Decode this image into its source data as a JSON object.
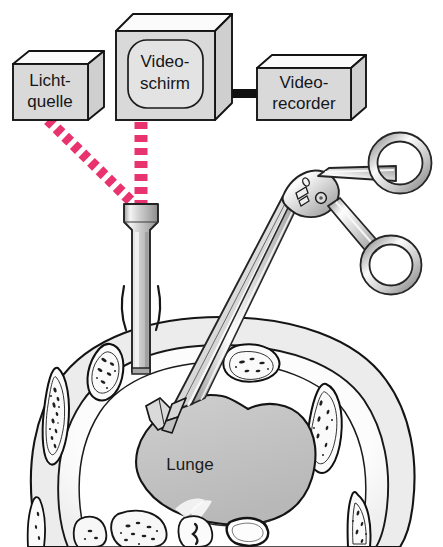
{
  "figure": {
    "background_color": "#ffffff",
    "width": 443,
    "height": 547
  },
  "equipment": {
    "light_source": {
      "label_line1": "Licht-",
      "label_line2": "quelle",
      "face_color": "#d9d9d9",
      "top_color": "#fbfbfb",
      "outline_color": "#1a1a1a"
    },
    "video_monitor": {
      "label_line1": "Video-",
      "label_line2": "schirm",
      "face_color": "#d9d9d9",
      "top_color": "#fbfbfb",
      "screen_color": "#e3e3e3",
      "outline_color": "#1a1a1a"
    },
    "video_recorder": {
      "label_line1": "Video-",
      "label_line2": "recorder",
      "face_color": "#d9d9d9",
      "top_color": "#fbfbfb",
      "outline_color": "#1a1a1a"
    },
    "cable": {
      "name": "monitor-to-recorder-cable",
      "color": "#111111"
    }
  },
  "signal_beams": {
    "color": "#e8336e",
    "beams": [
      {
        "name": "light-cable-beam",
        "from": "light_source",
        "to": "scope_head"
      },
      {
        "name": "video-cable-beam",
        "from": "video_monitor",
        "to": "scope_head"
      }
    ]
  },
  "instruments": {
    "thoracoscope": {
      "name": "thoracoscope-trocar",
      "body_color": "#c8c8c8",
      "highlight_color": "#f2f2f2",
      "outline_color": "#2a2a2a"
    },
    "forceps": {
      "name": "surgical-forceps",
      "body_color": "#dcdcdc",
      "highlight_color": "#fdfdfd",
      "shadow_color": "#9a9a9a",
      "outline_color": "#2a2a2a",
      "ring_count": 2
    }
  },
  "anatomy": {
    "section_title": "Thorax cross-section",
    "lung": {
      "label": "Lunge",
      "fill_color": "#c4c4c4",
      "outline_color": "#1a1a1a"
    },
    "chest_wall": {
      "name": "chest-wall",
      "fill_color": "#ececec",
      "outline_color": "#1a1a1a"
    },
    "pleural_cavity": {
      "name": "pleural-cavity",
      "fill_color": "#ffffff"
    },
    "ribs": {
      "name": "rib",
      "count": 7,
      "fill_color": "#fafafa",
      "marrow_color": "#1e1e1e",
      "outline_color": "#101010"
    },
    "mediastinum": {
      "name": "mediastinal-structures",
      "fill_color": "#f7f7f7",
      "outline_color": "#151515"
    }
  }
}
